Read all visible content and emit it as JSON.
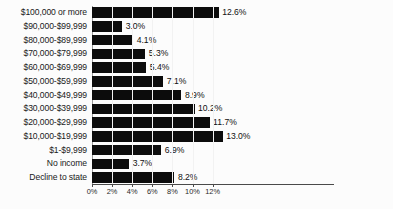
{
  "chart_data": {
    "type": "bar",
    "orientation": "horizontal",
    "title": "",
    "subtitle": "",
    "xlabel": "",
    "ylabel": "",
    "grid": true,
    "legend": null,
    "xlim": [
      0,
      14
    ],
    "xticks": [
      "0%",
      "2%",
      "4%",
      "6%",
      "8%",
      "10%",
      "12%"
    ],
    "xtick_values": [
      0,
      2,
      4,
      6,
      8,
      10,
      12
    ],
    "categories": [
      "$100,000 or more",
      "$90,000-$99,999",
      "$80,000-$89,999",
      "$70,000-$79,999",
      "$60,000-$69,999",
      "$50,000-$59,999",
      "$40,000-$49,999",
      "$30,000-$39,999",
      "$20,000-$29,999",
      "$10,000-$19,999",
      "$1-$9,999",
      "No income",
      "Decline to state"
    ],
    "values": [
      12.6,
      3.0,
      4.1,
      5.3,
      5.4,
      7.1,
      8.9,
      10.2,
      11.7,
      13.0,
      6.9,
      3.7,
      8.2
    ],
    "value_labels": [
      "12.6%",
      "3.0%",
      "4.1%",
      "5.3%",
      "5.4%",
      "7.1%",
      "8.9%",
      "10.2%",
      "11.7%",
      "13.0%",
      "6.9%",
      "3.7%",
      "8.2%"
    ],
    "bar_color": "#0c0c0c",
    "background_color": "#fcfcfc",
    "gridline_color": "#b9b9b9",
    "axis_color": "#4a4a4a"
  }
}
